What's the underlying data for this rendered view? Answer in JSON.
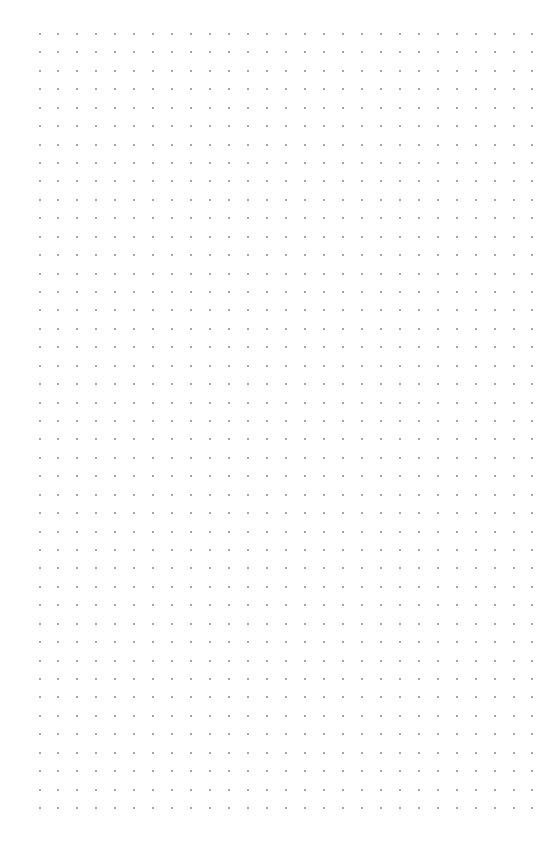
{
  "page": {
    "type": "dot-grid-paper",
    "background_color": "#ffffff"
  },
  "grid": {
    "columns": 27,
    "rows": 43,
    "origin_x": 39.5,
    "origin_y": 34,
    "step_x": 18.96,
    "step_y": 18.43,
    "dot_size": 2,
    "dot_color": "#8a8a8a"
  }
}
